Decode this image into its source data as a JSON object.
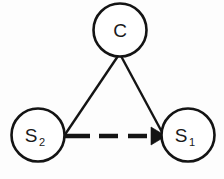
{
  "figure": {
    "background_color": "#fdfdfd",
    "stroke_color": "#141414",
    "node_fill_color": "#ffffff",
    "width": 224,
    "height": 179
  },
  "nodes": [
    {
      "id": "C",
      "label": "C",
      "subscript": "",
      "cx": 120,
      "cy": 30,
      "r": 26.5,
      "label_x": 120,
      "label_y": 37
    },
    {
      "id": "S2",
      "label": "S",
      "subscript": "2",
      "cx": 38,
      "cy": 135,
      "r": 26.5,
      "label_x": 31,
      "label_y": 142
    },
    {
      "id": "S1",
      "label": "S",
      "subscript": "1",
      "cx": 188,
      "cy": 135,
      "r": 26.5,
      "label_x": 181,
      "label_y": 142
    }
  ],
  "edges": [
    {
      "id": "c-to-s2",
      "from": "C",
      "to": "S2",
      "style": "solid",
      "arrow": false,
      "x1": 118,
      "y1": 56,
      "x2": 64,
      "y2": 136
    },
    {
      "id": "c-to-s1",
      "from": "C",
      "to": "S1",
      "style": "solid",
      "arrow": false,
      "x1": 121,
      "y1": 56,
      "x2": 163,
      "y2": 134
    },
    {
      "id": "s2-to-s1",
      "from": "S2",
      "to": "S1",
      "style": "dashed",
      "arrow": true,
      "x1": 65,
      "y1": 136,
      "x2": 152,
      "y2": 136,
      "dash_pattern": "25 9 19 10 19 10",
      "arrow_tip_x": 166,
      "arrow_tip_y": 136,
      "arrow_back_x": 151,
      "arrow_half_height": 9
    }
  ],
  "legend": {
    "solid_edge_meaning": "",
    "dashed_edge_meaning": ""
  }
}
